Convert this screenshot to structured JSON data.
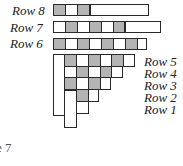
{
  "labels": {
    "row8": "Row 8",
    "row7": "Row 7",
    "row6": "Row 6",
    "row5": "Row 5",
    "row4": "Row 4",
    "row3": "Row 3",
    "row2": "Row 2",
    "row1": "Row 1",
    "caption_fragment": "e 7"
  },
  "colors": {
    "shaded": "#b4b4b4",
    "blank": "#ffffff",
    "border": "#2a2a2a"
  },
  "rows": {
    "row8": [
      "gray",
      "white",
      "gray",
      "long-bar"
    ],
    "row7": [
      "white",
      "gray",
      "white",
      "gray",
      "white",
      "gray",
      "long-bar"
    ],
    "row6": [
      "gray",
      "white",
      "gray",
      "white",
      "gray",
      "white",
      "gray",
      "white"
    ],
    "row5": [
      "gray",
      "white",
      "gray",
      "white",
      "gray",
      "white"
    ],
    "row4": [
      "white",
      "gray",
      "white",
      "gray",
      "white"
    ],
    "row3": [
      "gray",
      "white",
      "gray",
      "white"
    ],
    "row2": [
      "gray",
      "white"
    ],
    "row1": [
      "white"
    ]
  }
}
